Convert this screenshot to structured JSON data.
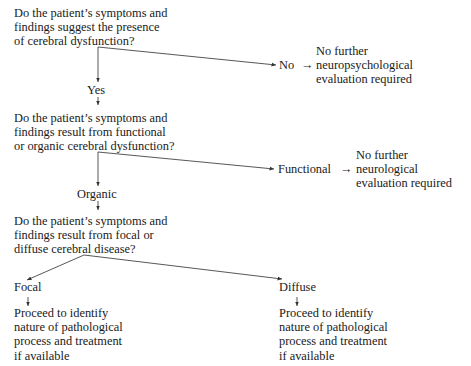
{
  "flowchart": {
    "q1": {
      "lines": [
        "Do the patient’s symptoms and",
        "findings suggest the presence",
        "of cerebral dysfunction?"
      ]
    },
    "no_label": "No",
    "no_outcome": {
      "lines": [
        "No further",
        "neuropsychological",
        "evaluation required"
      ]
    },
    "yes_label": "Yes",
    "q2": {
      "lines": [
        "Do the patient’s symptoms and",
        "findings result from functional",
        "or organic cerebral dysfunction?"
      ]
    },
    "functional_label": "Functional",
    "functional_outcome": {
      "lines": [
        "No further",
        "neurological",
        "evaluation required"
      ]
    },
    "organic_label": "Organic",
    "q3": {
      "lines": [
        "Do the patient’s symptoms and",
        "findings result from focal or",
        "diffuse cerebral disease?"
      ]
    },
    "focal_label": "Focal",
    "diffuse_label": "Diffuse",
    "focal_outcome": {
      "lines": [
        "Proceed to identify",
        "nature of pathological",
        "process and treatment",
        "if available"
      ]
    },
    "diffuse_outcome": {
      "lines": [
        "Proceed to identify",
        "nature of pathological",
        "process and treatment",
        "if available"
      ]
    },
    "arrow_glyph": "→",
    "down_arrow_glyph": "↓"
  }
}
